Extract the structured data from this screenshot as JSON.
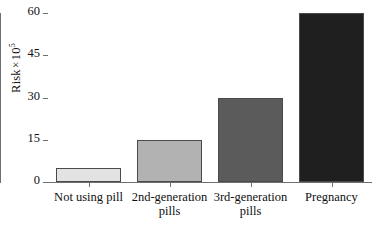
{
  "chart_data": {
    "type": "bar",
    "title": "",
    "xlabel": "",
    "ylabel": "Risk × 10",
    "ylabel_base": "Risk",
    "ylabel_times": "×",
    "ylabel_mantissa": "10",
    "ylabel_exponent": "5",
    "categories": [
      "Not using pill",
      "2nd-generation\npills",
      "3rd-generation\npills",
      "Pregnancy"
    ],
    "values": [
      5,
      15,
      30,
      60
    ],
    "ylim": [
      0,
      60
    ],
    "yticks": [
      0,
      15,
      30,
      45,
      60
    ],
    "ytick_labels": [
      "0",
      "15",
      "30",
      "45",
      "60"
    ],
    "grid": false,
    "legend": "none",
    "bar_colors": [
      "#e3e3e3",
      "#b2b2b2",
      "#5b5b5b",
      "#1f1f1f"
    ],
    "bar_edge_color": "#4a4a4a",
    "axis_color": "#6f6f6f",
    "text_color": "#101010",
    "background": "#ffffff"
  }
}
